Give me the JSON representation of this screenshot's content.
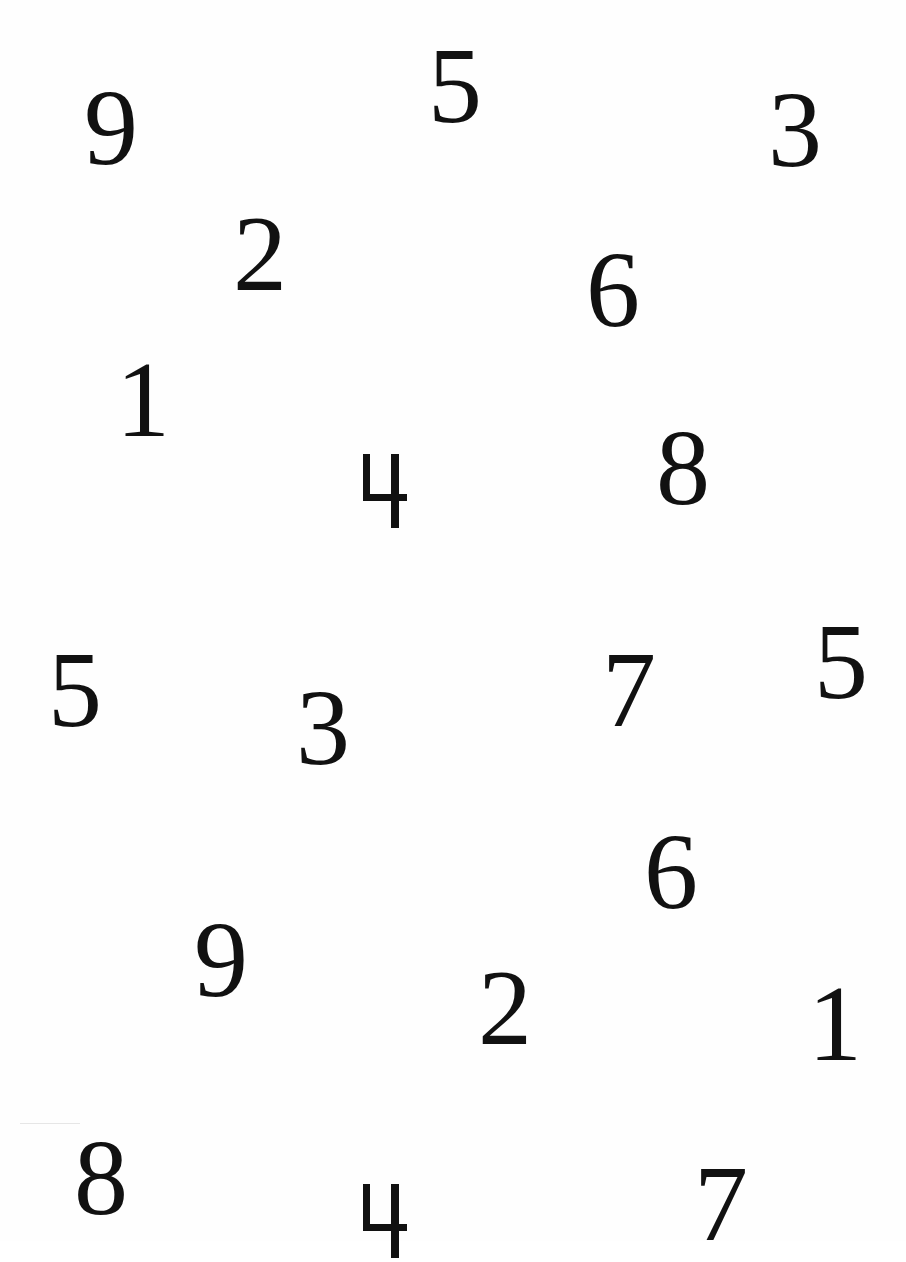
{
  "page": {
    "background": "#ffffff",
    "ink_color": "#111111"
  },
  "digits": [
    {
      "value": "9",
      "x": 84,
      "y": 74,
      "size": 108
    },
    {
      "value": "5",
      "x": 428,
      "y": 32,
      "size": 108
    },
    {
      "value": "3",
      "x": 768,
      "y": 76,
      "size": 108
    },
    {
      "value": "2",
      "x": 233,
      "y": 200,
      "size": 108
    },
    {
      "value": "6",
      "x": 586,
      "y": 236,
      "size": 108
    },
    {
      "value": "1",
      "x": 116,
      "y": 346,
      "size": 108
    },
    {
      "value": "4",
      "x": 363,
      "y": 454,
      "size": 74,
      "glyph": "open-four"
    },
    {
      "value": "8",
      "x": 656,
      "y": 414,
      "size": 108
    },
    {
      "value": "5",
      "x": 48,
      "y": 636,
      "size": 108
    },
    {
      "value": "3",
      "x": 296,
      "y": 674,
      "size": 108
    },
    {
      "value": "7",
      "x": 602,
      "y": 636,
      "size": 108
    },
    {
      "value": "5",
      "x": 814,
      "y": 608,
      "size": 108
    },
    {
      "value": "6",
      "x": 644,
      "y": 818,
      "size": 108
    },
    {
      "value": "9",
      "x": 194,
      "y": 906,
      "size": 108
    },
    {
      "value": "2",
      "x": 478,
      "y": 954,
      "size": 108
    },
    {
      "value": "1",
      "x": 808,
      "y": 970,
      "size": 108
    },
    {
      "value": "8",
      "x": 74,
      "y": 1124,
      "size": 108
    },
    {
      "value": "4",
      "x": 363,
      "y": 1184,
      "size": 74,
      "glyph": "open-four"
    },
    {
      "value": "7",
      "x": 694,
      "y": 1150,
      "size": 108
    }
  ]
}
